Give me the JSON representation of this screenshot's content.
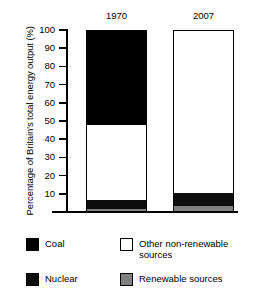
{
  "chart_data": {
    "type": "bar",
    "subtype": "stacked-100-percent",
    "title": "",
    "xlabel": "",
    "ylabel": "Percentage of Britain's total energy output (%)",
    "ylim": [
      0,
      100
    ],
    "yticks": [
      100,
      90,
      80,
      70,
      60,
      50,
      40,
      30,
      20,
      10
    ],
    "ytick_labels": [
      "100",
      "90",
      "80",
      "70",
      "60",
      "50",
      "40",
      "30",
      "20",
      "10"
    ],
    "grid": false,
    "legend_position": "bottom",
    "categories": [
      "1970",
      "2007"
    ],
    "series": [
      {
        "name": "Coal",
        "color": "#000000",
        "values": [
          52,
          0
        ]
      },
      {
        "name": "Other non-renewable sources",
        "color": "#ffffff",
        "values": [
          42,
          90
        ]
      },
      {
        "name": "Nuclear",
        "color": "#0d0d0d",
        "values": [
          5,
          7
        ]
      },
      {
        "name": "Renewable sources",
        "color": "#808080",
        "values": [
          1,
          3
        ]
      }
    ],
    "annotations": []
  },
  "axis": {
    "y_title": "Percentage of Britain's total energy output (%)",
    "ticks": [
      "100",
      "90",
      "80",
      "70",
      "60",
      "50",
      "40",
      "30",
      "20",
      "10"
    ]
  },
  "bars": [
    {
      "label": "1970",
      "segments": [
        {
          "name": "Coal",
          "value": 52
        },
        {
          "name": "Other non-renewable sources",
          "value": 42
        },
        {
          "name": "Nuclear",
          "value": 5
        },
        {
          "name": "Renewable sources",
          "value": 1
        }
      ]
    },
    {
      "label": "2007",
      "segments": [
        {
          "name": "Coal",
          "value": 0
        },
        {
          "name": "Other non-renewable sources",
          "value": 90
        },
        {
          "name": "Nuclear",
          "value": 7
        },
        {
          "name": "Renewable sources",
          "value": 3
        }
      ]
    }
  ],
  "legend": {
    "items": [
      {
        "label": "Coal",
        "color": "#000000"
      },
      {
        "label": "Other non-renewable sources",
        "color": "#ffffff"
      },
      {
        "label": "Nuclear",
        "color": "#0d0d0d"
      },
      {
        "label": "Renewable sources",
        "color": "#808080"
      }
    ]
  }
}
